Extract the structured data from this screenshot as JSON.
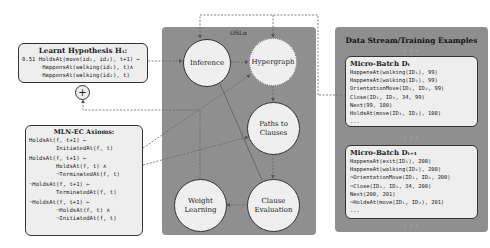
{
  "hypothesis": {
    "title": "Learnt Hypothesis Hₜ:",
    "lines": [
      "0.51 HoldsAt(move(id₁, id₂), t+1) ⇐",
      "      HappensAt(walking(id₁), t)∧",
      "      HappensAt(walking(id₂), t)"
    ],
    "plus_symbol": "+"
  },
  "axioms": {
    "title": "MLN-EC Axioms:",
    "lines": [
      "HoldsAt(f, t+1) ⇐",
      "        InitiatedAt(f, t)",
      "HoldsAt(f, t+1) ⇐",
      "        HoldsAt(f, t) ∧",
      "        ¬TerminatedAt(f, t)",
      "¬HoldsAt(f, t+1) ⇐",
      "        TerminatedAt(f, t)",
      "¬HoldsAt(f, t+1) ⇐",
      "        ¬HoldsAt(f, t) ∧",
      "        ¬InitiatedAt(f, t)"
    ]
  },
  "osl": {
    "label": "OSLα",
    "nodes": {
      "inference": "Inference",
      "hypergraph": "Hypergraph",
      "paths_to_clauses": [
        "Paths to",
        "Clauses"
      ],
      "weight_learning": [
        "Weight",
        "Learning"
      ],
      "clause_evaluation": [
        "Clause",
        "Evaluation"
      ]
    }
  },
  "data_stream": {
    "title": "Data Stream/Training Examples",
    "ellipsis": "· · ·",
    "batches": [
      {
        "title": "Micro-Batch Dₜ",
        "lines": [
          "HappensAt(walking(ID₁), 99)",
          "HappensAt(walking(ID₂), 99)",
          "OrientationMove(ID₁, ID₂, 99)",
          "Close(ID₁, ID₂, 34, 99)",
          "Next(99, 100)",
          "HoldsAt(move(ID₁, ID₂), 100)",
          "..."
        ]
      },
      {
        "title": "Micro-Batch Dₜ₊₁",
        "lines": [
          "HappensAt(exit(ID₁), 200)",
          "HappensAt(walking(ID₂), 200)",
          "¬OrientationMove(ID₁, ID₂, 200)",
          "¬Close(ID₁, ID₂, 34, 200)",
          "Next(200, 201)",
          "¬HoldsAt(move(ID₁, ID₂), 201)",
          "..."
        ]
      }
    ]
  },
  "colors": {
    "panel_gray": "#8f8f8f",
    "box_fill": "#eeeeee",
    "border": "#333333",
    "connector": "#555555"
  }
}
